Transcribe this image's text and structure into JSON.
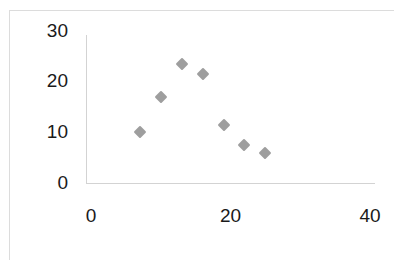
{
  "chart_data": {
    "type": "scatter",
    "title": "",
    "subtitle": "",
    "xlabel": "",
    "ylabel": "",
    "xlim": [
      0,
      40
    ],
    "ylim": [
      0,
      30
    ],
    "xticks": [
      0,
      20,
      40
    ],
    "yticks": [
      0,
      10,
      20,
      30
    ],
    "xtick_labels": [
      "0",
      "20",
      "40"
    ],
    "ytick_labels": [
      "0",
      "10",
      "20",
      "30"
    ],
    "grid": false,
    "legend": null,
    "legend_position": "none",
    "marker": "diamond",
    "marker_color": "#969696",
    "axis_color": "#d3d3d3",
    "background_color": "#ffffff",
    "border_color": "#dcdcdc",
    "series": [
      {
        "name": "",
        "points": [
          {
            "x": 7,
            "y": 10
          },
          {
            "x": 10,
            "y": 17
          },
          {
            "x": 13,
            "y": 23.5
          },
          {
            "x": 16,
            "y": 21.5
          },
          {
            "x": 19,
            "y": 11.5
          },
          {
            "x": 22,
            "y": 7.5
          },
          {
            "x": 25,
            "y": 6
          }
        ]
      }
    ]
  }
}
